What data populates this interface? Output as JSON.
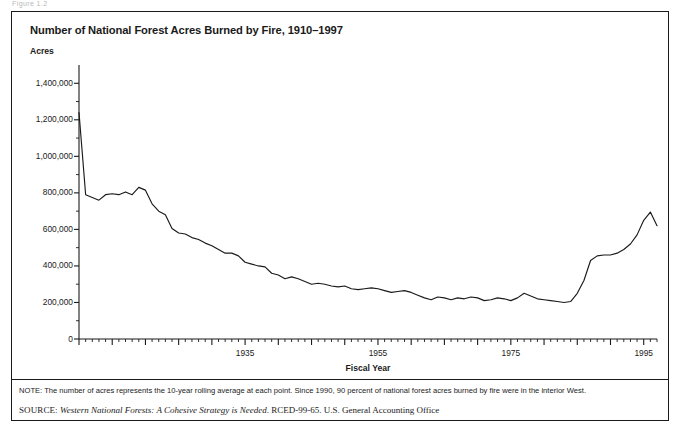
{
  "figure": {
    "top_crumb": "Figure 1.2",
    "note_label": "NOTE:",
    "note_text": "NOTE: The number of acres represents the 10-year rolling average at each point. Since 1990, 90 percent of national forest acres burned by fire were in the interior West.",
    "source_label": "SOURCE:",
    "source_doc": "Western National Forests: A Cohesive Strategy is Needed",
    "source_rest": ". RCED-99-65. U.S. General Accounting Office"
  },
  "chart_data": {
    "type": "line",
    "title": "Number of National Forest Acres Burned by Fire, 1910–1997",
    "xlabel": "Fiscal Year",
    "ylabel": "Acres",
    "xlim": [
      1910,
      1997
    ],
    "ylim": [
      0,
      1500000
    ],
    "ytick_values": [
      0,
      200000,
      400000,
      600000,
      800000,
      1000000,
      1200000,
      1400000
    ],
    "ytick_labels": [
      "0",
      "200,000",
      "400,000",
      "600,000",
      "800,000",
      "1,000,000",
      "1,200,000",
      "1,400,000"
    ],
    "yminor_step": 100000,
    "xtick_labeled": [
      1935,
      1955,
      1975,
      1995
    ],
    "xtick_labels": [
      "1935",
      "1955",
      "1975",
      "1995"
    ],
    "xminor_step": 1,
    "xmajor_step": 5,
    "grid": false,
    "legend": false,
    "line_color": "#1a1a1a",
    "series": [
      {
        "name": "National forest acres burned (10-year rolling average)",
        "x": [
          1910,
          1911,
          1912,
          1913,
          1914,
          1915,
          1916,
          1917,
          1918,
          1919,
          1920,
          1921,
          1922,
          1923,
          1924,
          1925,
          1926,
          1927,
          1928,
          1929,
          1930,
          1931,
          1932,
          1933,
          1934,
          1935,
          1936,
          1937,
          1938,
          1939,
          1940,
          1941,
          1942,
          1943,
          1944,
          1945,
          1946,
          1947,
          1948,
          1949,
          1950,
          1951,
          1952,
          1953,
          1954,
          1955,
          1956,
          1957,
          1958,
          1959,
          1960,
          1961,
          1962,
          1963,
          1964,
          1965,
          1966,
          1967,
          1968,
          1969,
          1970,
          1971,
          1972,
          1973,
          1974,
          1975,
          1976,
          1977,
          1978,
          1979,
          1980,
          1981,
          1982,
          1983,
          1984,
          1985,
          1986,
          1987,
          1988,
          1989,
          1990,
          1991,
          1992,
          1993,
          1994,
          1995,
          1996,
          1997
        ],
        "values": [
          1240000,
          790000,
          775000,
          760000,
          790000,
          795000,
          790000,
          805000,
          790000,
          830000,
          815000,
          740000,
          700000,
          680000,
          605000,
          580000,
          575000,
          555000,
          545000,
          525000,
          510000,
          490000,
          470000,
          470000,
          455000,
          420000,
          410000,
          400000,
          395000,
          360000,
          350000,
          330000,
          340000,
          330000,
          315000,
          300000,
          305000,
          300000,
          290000,
          285000,
          290000,
          275000,
          270000,
          275000,
          280000,
          275000,
          265000,
          255000,
          260000,
          265000,
          255000,
          240000,
          225000,
          215000,
          230000,
          225000,
          215000,
          225000,
          220000,
          230000,
          225000,
          210000,
          215000,
          225000,
          220000,
          210000,
          225000,
          250000,
          235000,
          220000,
          215000,
          210000,
          205000,
          200000,
          205000,
          250000,
          320000,
          430000,
          455000,
          460000,
          460000,
          470000,
          490000,
          520000,
          570000,
          650000,
          695000,
          620000
        ]
      }
    ]
  }
}
